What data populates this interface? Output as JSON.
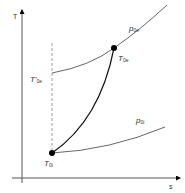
{
  "diagram": {
    "type": "T-s diagram",
    "axes": {
      "y_label": "T",
      "x_label": "s"
    },
    "isobars": [
      {
        "id": "p0e",
        "label_main": "p",
        "label_sub": "0e"
      },
      {
        "id": "p0i",
        "label_main": "p",
        "label_sub": "0i"
      }
    ],
    "points": [
      {
        "id": "T0i",
        "label_main": "T",
        "label_sub": "0i"
      },
      {
        "id": "T0e",
        "label_main": "T",
        "label_sub": "0e"
      },
      {
        "id": "T0e_prime",
        "label_main": "T'",
        "label_sub": "0e"
      }
    ],
    "colors": {
      "line": "#444444",
      "point": "#000000",
      "dashed": "#888888",
      "background": "#ffffff"
    }
  }
}
